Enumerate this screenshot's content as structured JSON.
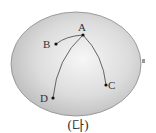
{
  "diagram": {
    "shape": {
      "type": "ellipse",
      "cx": 76,
      "cy": 64,
      "rx": 65,
      "ry": 52,
      "fill_center": "#f4f4f4",
      "fill_edge": "#bdbdbd",
      "stroke": "#8a8a8a"
    },
    "points": [
      {
        "id": "A",
        "label": "A",
        "x": 83,
        "y": 35,
        "label_x": 82,
        "label_y": 31
      },
      {
        "id": "B",
        "label": "B",
        "x": 56,
        "y": 44,
        "label_x": 48,
        "label_y": 47
      },
      {
        "id": "C",
        "label": "C",
        "x": 106,
        "y": 85,
        "label_x": 113,
        "label_y": 89
      },
      {
        "id": "D",
        "label": "D",
        "x": 53,
        "y": 98,
        "label_x": 46,
        "label_y": 102
      }
    ],
    "curves": [
      {
        "from": "A",
        "to": "B"
      },
      {
        "from": "A",
        "to": "C"
      },
      {
        "from": "A",
        "to": "D"
      }
    ],
    "colors": {
      "line": "#444444",
      "point": "#111111",
      "label": "#333333"
    },
    "caption": "(다)"
  }
}
